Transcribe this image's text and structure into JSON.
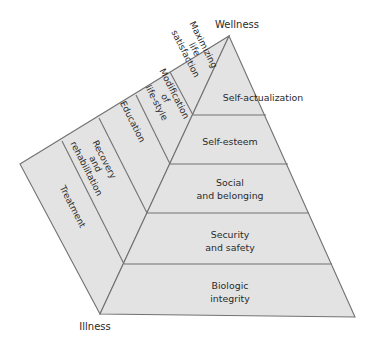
{
  "diagram": {
    "type": "pyramid",
    "poles": {
      "top": "Wellness",
      "bottom": "Illness"
    },
    "pyramid_levels": [
      {
        "line1": "Self-actualization",
        "line2": ""
      },
      {
        "line1": "Self-esteem",
        "line2": ""
      },
      {
        "line1": "Social",
        "line2": "and belonging"
      },
      {
        "line1": "Security",
        "line2": "and safety"
      },
      {
        "line1": "Biologic",
        "line2": "integrity"
      }
    ],
    "side_bands": [
      {
        "lines": [
          "Treatment"
        ]
      },
      {
        "lines": [
          "Recovery",
          "and",
          "rehabilitation"
        ]
      },
      {
        "lines": [
          "Education"
        ]
      },
      {
        "lines": [
          "Modification",
          "of",
          "life-style"
        ]
      },
      {
        "lines": [
          "Maximizing",
          "life",
          "satisfaction"
        ]
      }
    ],
    "colors": {
      "fill": "#e3e3e3",
      "stroke": "#727272",
      "text": "#2a2a2a"
    }
  }
}
